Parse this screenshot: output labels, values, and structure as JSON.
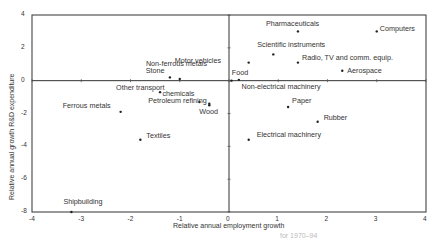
{
  "chart_data": {
    "type": "scatter",
    "title": "",
    "xlabel": "Relative annual employment growth",
    "ylabel": "Relative annual growth R&D expenditure",
    "xlim": [
      -4,
      4
    ],
    "ylim": [
      -8,
      4
    ],
    "xticks": [
      "-4",
      "-3",
      "-2",
      "-1",
      "0",
      "1",
      "2",
      "3",
      "4"
    ],
    "yticks": [
      "4",
      "2",
      "0",
      "-2",
      "-4",
      "-6",
      "-8"
    ],
    "grid": false,
    "reference_lines": {
      "x": 0,
      "y": 0
    },
    "points": [
      {
        "label": "Computers",
        "x": 3.0,
        "y": 3.0
      },
      {
        "label": "Pharmaceuticals",
        "x": 1.4,
        "y": 3.0
      },
      {
        "label": "Scientific instruments",
        "x": 0.9,
        "y": 1.6
      },
      {
        "label": "Motor vehicles",
        "x": 0.4,
        "y": 1.1
      },
      {
        "label": "Radio, TV and comm. equip.",
        "x": 1.4,
        "y": 1.1
      },
      {
        "label": "Aerospace",
        "x": 2.3,
        "y": 0.6
      },
      {
        "label": "Food",
        "x": 0.2,
        "y": 0.05
      },
      {
        "label": "Non-electrical machinery",
        "x": 0.05,
        "y": 0.0
      },
      {
        "label": "Paper",
        "x": 1.2,
        "y": -1.6
      },
      {
        "label": "Rubber",
        "x": 1.8,
        "y": -2.5
      },
      {
        "label": "Electrical machinery",
        "x": 0.4,
        "y": -3.6
      },
      {
        "label": "Non-ferrous metals",
        "x": -1.2,
        "y": 0.2
      },
      {
        "label": "Stone",
        "x": -1.0,
        "y": 0.1
      },
      {
        "label": "Other transport",
        "x": -1.4,
        "y": -0.7
      },
      {
        "label": "chemicals",
        "x": -0.6,
        "y": -1.3
      },
      {
        "label": "Petroleum refining",
        "x": -0.4,
        "y": -1.4
      },
      {
        "label": "Wood",
        "x": -0.4,
        "y": -1.5
      },
      {
        "label": "Ferrous metals",
        "x": -2.2,
        "y": -1.9
      },
      {
        "label": "Textiles",
        "x": -1.8,
        "y": -3.6
      },
      {
        "label": "Shipbuilding",
        "x": -3.2,
        "y": -8.0
      }
    ]
  },
  "caption_fragment": "for 1970–94"
}
